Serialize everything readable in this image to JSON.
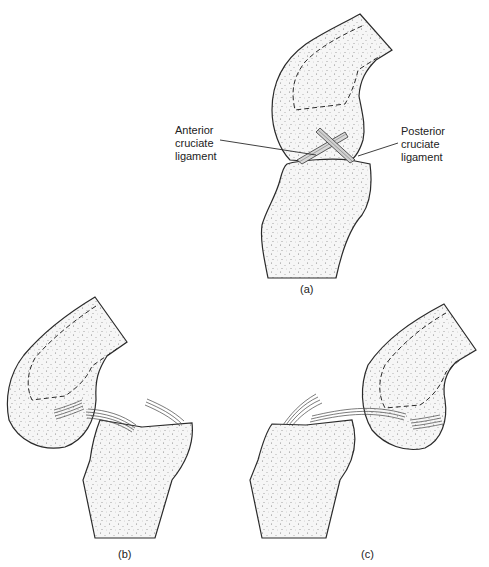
{
  "figure": {
    "panels": [
      {
        "id": "a",
        "caption": "(a)",
        "description": "Knee joint in flexion showing crossed cruciate ligaments"
      },
      {
        "id": "b",
        "caption": "(b)",
        "description": "Anterior cruciate ligament torn"
      },
      {
        "id": "c",
        "caption": "(c)",
        "description": "Posterior cruciate ligament torn"
      }
    ],
    "labels": {
      "anterior": [
        "Anterior",
        "cruciate",
        "ligament"
      ],
      "posterior": [
        "Posterior",
        "cruciate",
        "ligament"
      ]
    },
    "colors": {
      "outline": "#2a2a2a",
      "fill": "#f4f4f4",
      "stipple": "#8a8a8a"
    }
  }
}
